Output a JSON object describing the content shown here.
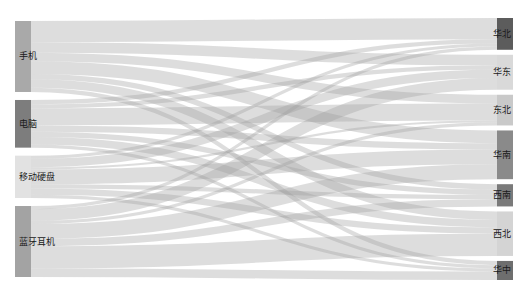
{
  "chart_data": {
    "type": "sankey",
    "title": "",
    "colors": {
      "background": "#ffffff",
      "link": "#9e9e9e",
      "link_opacity": 0.35,
      "label": "#1a1a1a"
    },
    "layout": {
      "left_x": 15,
      "right_x": 497,
      "node_width": 16,
      "top": 18,
      "bottom": 280,
      "left_gap": 8,
      "right_gap": 5
    },
    "sources": [
      {
        "name": "手机",
        "color": "#a9a9a9"
      },
      {
        "name": "电脑",
        "color": "#7d7d7d"
      },
      {
        "name": "移动硬盘",
        "color": "#e2e2e2"
      },
      {
        "name": "蓝牙耳机",
        "color": "#a3a3a3"
      }
    ],
    "targets": [
      {
        "name": "华北",
        "color": "#5c5c5c"
      },
      {
        "name": "华东",
        "color": "#d9d9d9"
      },
      {
        "name": "东北",
        "color": "#c9c9c9"
      },
      {
        "name": "华南",
        "color": "#8a8a8a"
      },
      {
        "name": "西南",
        "color": "#7a7a7a"
      },
      {
        "name": "西北",
        "color": "#d4d4d4"
      },
      {
        "name": "华中",
        "color": "#6e6e6e"
      }
    ],
    "links": [
      {
        "source": "手机",
        "target": "华北",
        "value": 20
      },
      {
        "source": "手机",
        "target": "华东",
        "value": 10
      },
      {
        "source": "手机",
        "target": "东北",
        "value": 8
      },
      {
        "source": "手机",
        "target": "华南",
        "value": 12
      },
      {
        "source": "手机",
        "target": "西南",
        "value": 5
      },
      {
        "source": "手机",
        "target": "西北",
        "value": 8
      },
      {
        "source": "手机",
        "target": "华中",
        "value": 4
      },
      {
        "source": "电脑",
        "target": "华北",
        "value": 4
      },
      {
        "source": "电脑",
        "target": "华东",
        "value": 4
      },
      {
        "source": "电脑",
        "target": "东北",
        "value": 16
      },
      {
        "source": "电脑",
        "target": "华南",
        "value": 6
      },
      {
        "source": "电脑",
        "target": "西南",
        "value": 5
      },
      {
        "source": "电脑",
        "target": "西北",
        "value": 7
      },
      {
        "source": "电脑",
        "target": "华中",
        "value": 3
      },
      {
        "source": "移动硬盘",
        "target": "华北",
        "value": 3
      },
      {
        "source": "移动硬盘",
        "target": "华东",
        "value": 8
      },
      {
        "source": "移动硬盘",
        "target": "东北",
        "value": 2
      },
      {
        "source": "移动硬盘",
        "target": "华南",
        "value": 14
      },
      {
        "source": "移动硬盘",
        "target": "西南",
        "value": 4
      },
      {
        "source": "移动硬盘",
        "target": "西北",
        "value": 6
      },
      {
        "source": "移动硬盘",
        "target": "华中",
        "value": 3
      },
      {
        "source": "蓝牙耳机",
        "target": "华北",
        "value": 3
      },
      {
        "source": "蓝牙耳机",
        "target": "华东",
        "value": 11
      },
      {
        "source": "蓝牙耳机",
        "target": "东北",
        "value": 3
      },
      {
        "source": "蓝牙耳机",
        "target": "华南",
        "value": 14
      },
      {
        "source": "蓝牙耳机",
        "target": "西南",
        "value": 7
      },
      {
        "source": "蓝牙耳机",
        "target": "西北",
        "value": 21
      },
      {
        "source": "蓝牙耳机",
        "target": "华中",
        "value": 8
      }
    ]
  }
}
